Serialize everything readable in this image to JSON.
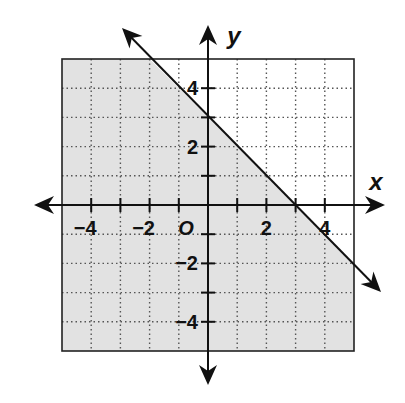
{
  "chart_data": {
    "type": "line",
    "title": "",
    "xlabel": "x",
    "ylabel": "y",
    "origin_label": "O",
    "xlim": [
      -5,
      5
    ],
    "ylim": [
      -5,
      5
    ],
    "grid": true,
    "grid_style": "dotted",
    "x_ticks": [
      -4,
      -3,
      -2,
      -1,
      1,
      2,
      3,
      4
    ],
    "y_ticks": [
      -4,
      -3,
      -2,
      -1,
      1,
      2,
      3,
      4
    ],
    "x_tick_labels": [
      "−4",
      "−2",
      "2",
      "4"
    ],
    "x_tick_label_values": [
      -4,
      -2,
      2,
      4
    ],
    "y_tick_labels": [
      "4",
      "2",
      "−2",
      "−4"
    ],
    "y_tick_label_values": [
      4,
      2,
      -2,
      -4
    ],
    "series": [
      {
        "name": "boundary line",
        "equation": "y = -x + 3",
        "slope": -1,
        "intercept": 3,
        "style": "solid",
        "arrows": "both",
        "points": [
          [
            -2.9,
            5.9
          ],
          [
            5.9,
            -2.9
          ]
        ]
      }
    ],
    "shaded_region": {
      "inequality": "y ≤ -x + 3",
      "side": "below",
      "color": "#e2e2e2"
    },
    "colors": {
      "axis": "#111111",
      "grid": "#555555",
      "shade": "#e2e2e2",
      "line": "#111111"
    }
  }
}
